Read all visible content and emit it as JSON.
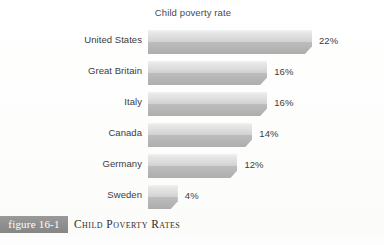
{
  "figure": {
    "badge_label": "figure 16-1",
    "caption": "Child Poverty Rates"
  },
  "chart_data": {
    "type": "bar",
    "orientation": "horizontal",
    "title": "Child poverty rate",
    "xlabel": "",
    "ylabel": "",
    "categories": [
      "United States",
      "Great Britain",
      "Italy",
      "Canada",
      "Germany",
      "Sweden"
    ],
    "values": [
      22,
      16,
      16,
      14,
      12,
      4
    ],
    "value_labels": [
      "22%",
      "16%",
      "16%",
      "14%",
      "12%",
      "4%"
    ],
    "unit": "%",
    "xlim": [
      0,
      22
    ],
    "grid": false,
    "legend": false,
    "bar_color": "#cfcfcf",
    "bar_style": "3d-beveled-gray-gradient"
  },
  "colors": {
    "badge_background": "#8e8e8e",
    "badge_text": "#ffffff",
    "text": "#3c3c3c",
    "page_background": "#fefefe"
  }
}
